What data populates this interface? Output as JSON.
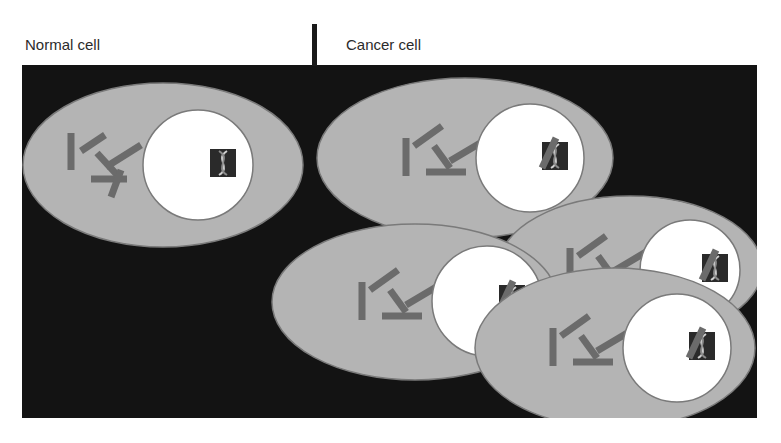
{
  "labels": {
    "normal": "Normal cell",
    "cancer": "Cancer cell"
  },
  "colors": {
    "background": "#131313",
    "cytoplasm": "#b4b4b4",
    "cell_outline": "#7a7a7a",
    "nucleus": "#ffffff",
    "organelle": "#6b6b6b",
    "dna_box": "#2a2a2a",
    "dna_strand": "#cfcfcf"
  },
  "cells": [
    {
      "type": "normal",
      "cx": 163,
      "cy": 165,
      "rx": 140,
      "ry": 82,
      "nx": 198,
      "ny": 165,
      "nr": 55,
      "damaged_dna": false
    },
    {
      "type": "cancer",
      "cx": 465,
      "cy": 158,
      "rx": 148,
      "ry": 80,
      "nx": 530,
      "ny": 158,
      "nr": 54,
      "damaged_dna": true
    },
    {
      "type": "cancer",
      "cx": 630,
      "cy": 268,
      "rx": 132,
      "ry": 72,
      "nx": 690,
      "ny": 270,
      "nr": 50,
      "damaged_dna": true
    },
    {
      "type": "cancer",
      "cx": 415,
      "cy": 302,
      "rx": 143,
      "ry": 78,
      "nx": 487,
      "ny": 301,
      "nr": 55,
      "damaged_dna": true
    },
    {
      "type": "cancer",
      "cx": 615,
      "cy": 348,
      "rx": 140,
      "ry": 80,
      "nx": 677,
      "ny": 348,
      "nr": 54,
      "damaged_dna": true
    }
  ],
  "icons": {
    "dna": "dna-double-helix-icon",
    "organelles": "rod-organelles"
  }
}
